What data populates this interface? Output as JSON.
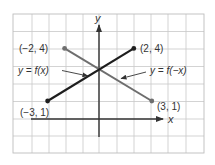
{
  "chart_data": {
    "type": "line",
    "title": "",
    "xlabel": "x",
    "ylabel": "y",
    "grid": true,
    "xlim": [
      -5,
      6
    ],
    "ylim": [
      -2,
      6
    ],
    "series": [
      {
        "name": "y = f(x)",
        "color": "#222222",
        "points": [
          [
            -3,
            1
          ],
          [
            2,
            4
          ]
        ]
      },
      {
        "name": "y = f(−x)",
        "color": "#6e6e6e",
        "points": [
          [
            -2,
            4
          ],
          [
            3,
            1
          ]
        ]
      }
    ],
    "annotations": [
      {
        "text": "(−2, 4)",
        "x": -2,
        "y": 4
      },
      {
        "text": "(2, 4)",
        "x": 2,
        "y": 4
      },
      {
        "text": "(−3, 1)",
        "x": -3,
        "y": 1
      },
      {
        "text": "(3, 1)",
        "x": 3,
        "y": 1
      },
      {
        "text": "y = f(x)",
        "arrow_to": "f(x) line"
      },
      {
        "text": "y = f(−x)",
        "arrow_to": "f(-x) line"
      }
    ]
  },
  "labels": {
    "x_axis": "x",
    "y_axis": "y",
    "pt_neg2_4": "(−2, 4)",
    "pt_2_4": "(2, 4)",
    "pt_neg3_1": "(−3, 1)",
    "pt_3_1": "(3, 1)",
    "fx_label": "y = f(x)",
    "fnegx_label": "y = f(−x)"
  }
}
